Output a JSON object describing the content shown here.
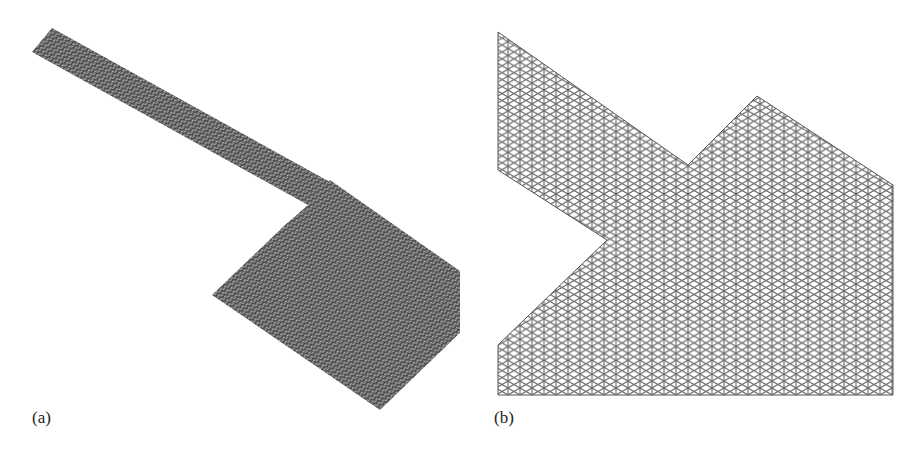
{
  "figure": {
    "panels": [
      {
        "id": "a",
        "label": "(a)",
        "description": "Full triangular finite-element mesh of a microstrip patch antenna with feed line (dense mesh, overall view)",
        "mesh_color": "#5a5a5a",
        "shape": {
          "feed_line": [
            [
              32,
              52
            ],
            [
              52,
              28
            ],
            [
              330,
              180
            ],
            [
              308,
              205
            ]
          ],
          "patch": [
            [
              308,
              205
            ],
            [
              330,
              180
            ],
            [
              497,
              297
            ],
            [
              380,
              410
            ],
            [
              212,
              295
            ],
            [
              285,
              225
            ]
          ]
        }
      },
      {
        "id": "b",
        "label": "(b)",
        "description": "Zoomed-in view of the triangular mesh near the junction between feed line and patch",
        "mesh_color": "#6a6a6a",
        "shape_outline": [
          [
            498,
            32
          ],
          [
            688,
            165
          ],
          [
            757,
            96
          ],
          [
            893,
            185
          ],
          [
            893,
            395
          ],
          [
            498,
            395
          ],
          [
            498,
            345
          ],
          [
            607,
            240
          ],
          [
            498,
            170
          ]
        ]
      }
    ]
  },
  "colors": {
    "background": "#ffffff",
    "mesh_dark": "#4a4a4a",
    "mesh_line": "#777777",
    "label_text": "#222222"
  }
}
